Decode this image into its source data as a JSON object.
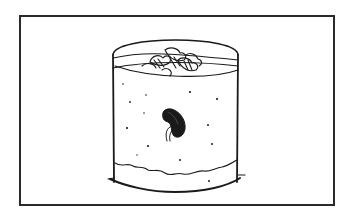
{
  "figure": {
    "elements": [
      "frame",
      "jar",
      "leaf-litter",
      "bean-seed",
      "root-sprout",
      "soil-particles",
      "soil-line"
    ]
  },
  "colors": {
    "ink": "#1a1a1a",
    "background": "#ffffff"
  }
}
